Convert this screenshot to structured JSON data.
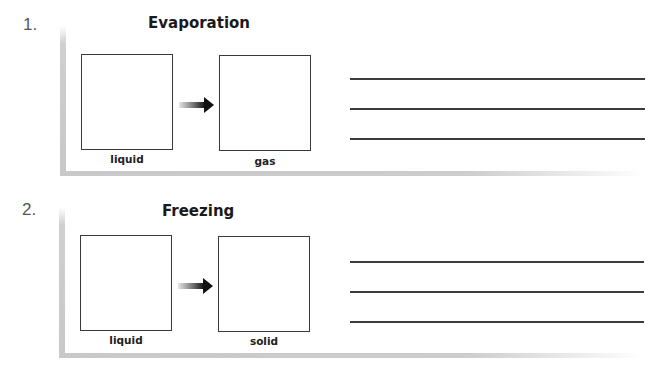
{
  "sections": [
    {
      "number": "1.",
      "title": "Evaporation",
      "from_label": "liquid",
      "to_label": "gas",
      "answer_lines": 3,
      "arrow_icon": "right-arrow"
    },
    {
      "number": "2.",
      "title": "Freezing",
      "from_label": "liquid",
      "to_label": "solid",
      "answer_lines": 3,
      "arrow_icon": "right-arrow"
    }
  ],
  "colors": {
    "box_border": "#3a3a3a",
    "frame": "#c8c8c8",
    "line": "#3c3c3c",
    "arrow": "#111111"
  }
}
